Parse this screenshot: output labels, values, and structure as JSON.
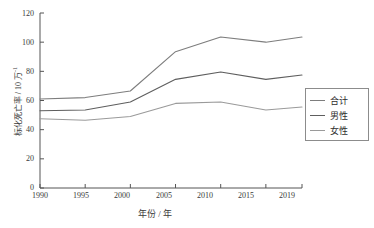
{
  "chart_data": {
    "type": "line",
    "title": "",
    "xlabel": "年份 / 年",
    "ylabel": "标化死亡率 / 10 万",
    "ylabel_sup": "-1",
    "x": [
      1990,
      1995,
      2000,
      2005,
      2010,
      2015,
      2019
    ],
    "categories": [
      "1990",
      "1995",
      "2000",
      "2005",
      "2010",
      "2015",
      "2019"
    ],
    "xlim": [
      1990,
      2019
    ],
    "ylim": [
      0,
      120
    ],
    "yticks": [
      0,
      20,
      40,
      60,
      80,
      100,
      120
    ],
    "xticks": [
      "1990",
      "1995",
      "2000",
      "2005",
      "2010",
      "2015",
      "2019"
    ],
    "grid": false,
    "legend_position": "right-outside",
    "series": [
      {
        "name": "合计",
        "color": "#7d7d7d",
        "values": [
          61.0,
          62.0,
          66.5,
          93.5,
          103.5,
          100.0,
          103.5
        ]
      },
      {
        "name": "男性",
        "color": "#5e5e5e",
        "values": [
          53.0,
          53.5,
          59.0,
          74.5,
          79.5,
          74.5,
          77.5
        ]
      },
      {
        "name": "女性",
        "color": "#9a9a9a",
        "values": [
          47.5,
          46.5,
          49.0,
          58.0,
          59.0,
          53.5,
          55.5
        ]
      }
    ]
  },
  "legend": {
    "items": [
      {
        "label": "合计"
      },
      {
        "label": "男性"
      },
      {
        "label": "女性"
      }
    ]
  },
  "axis": {
    "y_tick_labels": [
      "120",
      "100",
      "80",
      "60",
      "40",
      "20",
      "0"
    ],
    "x_tick_labels": [
      "1990",
      "1995",
      "2000",
      "2005",
      "2010",
      "2015",
      "2019"
    ]
  }
}
